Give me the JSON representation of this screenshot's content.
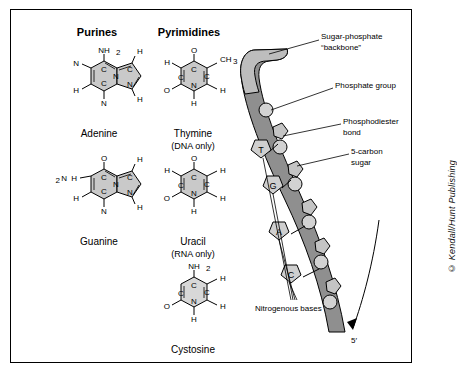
{
  "figure": {
    "headers": {
      "purines": "Purines",
      "pyrimidines": "Pyrimidines"
    },
    "molecules": [
      {
        "id": "adenine",
        "name": "Adenine",
        "sub": "",
        "top_group": "NH2",
        "ring_atoms": [
          "N",
          "C",
          "C",
          "N",
          "C",
          "N",
          "C",
          "N"
        ],
        "h_labels": [
          "H",
          "H",
          "H"
        ]
      },
      {
        "id": "guanine",
        "name": "Guanine",
        "sub": "",
        "top_group": "O",
        "left_group": "H2N",
        "ring_atoms": [
          "N",
          "C",
          "C",
          "N",
          "C",
          "N",
          "C",
          "N"
        ],
        "h_labels": [
          "H",
          "H"
        ]
      },
      {
        "id": "thymine",
        "name": "Thymine",
        "sub": "(DNA only)",
        "top_group": "O",
        "right_group": "CH3",
        "ring_atoms": [
          "C",
          "N",
          "C",
          "C",
          "C",
          "N"
        ],
        "h_labels": [
          "H",
          "H",
          "O"
        ]
      },
      {
        "id": "uracil",
        "name": "Uracil",
        "sub": "(RNA only)",
        "top_group": "O",
        "ring_atoms": [
          "C",
          "N",
          "C",
          "C",
          "C",
          "N"
        ],
        "h_labels": [
          "H",
          "H",
          "H",
          "O"
        ]
      },
      {
        "id": "cystosine",
        "name": "Cystosine",
        "sub": "",
        "top_group": "NH2",
        "ring_atoms": [
          "C",
          "N",
          "C",
          "C",
          "C",
          "N"
        ],
        "h_labels": [
          "H",
          "H",
          "O"
        ]
      }
    ],
    "annotations": [
      {
        "id": "backbone",
        "text": "Sugar-phosphate",
        "text2": "“backbone”"
      },
      {
        "id": "phosphate-group",
        "text": "Phosphate group"
      },
      {
        "id": "phosphodiester-bond",
        "text": "Phosphodiester",
        "text2": "bond"
      },
      {
        "id": "five-carbon-sugar",
        "text": "5-carbon",
        "text2": "sugar"
      },
      {
        "id": "nitrogenous-bases",
        "text": "Nitrogenous bases"
      },
      {
        "id": "five-prime",
        "text": "5′"
      }
    ],
    "bases_on_strand": [
      "T",
      "G",
      "A",
      "C"
    ],
    "colors": {
      "ring_fill": "#c9c9c9",
      "ring_fill_light": "#d8d8d8",
      "backbone_dark": "#8a8a8a",
      "backbone_light": "#b8b8b8",
      "outline": "#000000",
      "page_bg": "#ffffff"
    },
    "credit": "© Kendall/Hunt Publishing"
  }
}
